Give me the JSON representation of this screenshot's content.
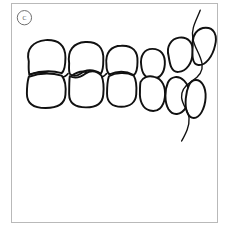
{
  "figure": {
    "panel_label": "C",
    "panel_label_shape": "circle",
    "caption_alt": "Lateral view line drawing of dental occlusion showing upper and lower posterior and anterior teeth with lip profile",
    "colors": {
      "line": "#111111",
      "background": "#ffffff",
      "panel_border": "#b9b9b9",
      "label": "#4a4a4a"
    },
    "illustration": {
      "type": "line-drawing",
      "subject": "dental-occlusion-lateral-view",
      "stroke_width_main": 2.6,
      "stroke_width_profile": 1.9,
      "upper_arch_label": "upper teeth row",
      "lower_arch_label": "lower teeth row",
      "profile_label": "lip soft tissue profile",
      "upper_teeth": [
        {
          "name": "upper-molar-1",
          "cx": 53,
          "cy": 85,
          "rx": 32,
          "ry": 26,
          "rot": -2,
          "kind": "molar"
        },
        {
          "name": "upper-molar-2",
          "cx": 112,
          "cy": 87,
          "rx": 28,
          "ry": 25,
          "rot": -1,
          "kind": "molar"
        },
        {
          "name": "upper-premolar-1",
          "cx": 166,
          "cy": 90,
          "rx": 26,
          "ry": 23,
          "rot": 0,
          "kind": "premolar"
        },
        {
          "name": "upper-premolar-2",
          "cx": 212,
          "cy": 92,
          "rx": 18,
          "ry": 22,
          "rot": 4,
          "kind": "premolar"
        },
        {
          "name": "upper-canine",
          "cx": 248,
          "cy": 83,
          "rx": 16,
          "ry": 24,
          "rot": 22,
          "kind": "canine"
        },
        {
          "name": "upper-incisor",
          "cx": 282,
          "cy": 76,
          "rx": 16,
          "ry": 25,
          "rot": 34,
          "kind": "incisor"
        }
      ],
      "lower_teeth": [
        {
          "name": "lower-molar-1",
          "cx": 53,
          "cy": 140,
          "rx": 32,
          "ry": 24,
          "rot": 1,
          "kind": "molar"
        },
        {
          "name": "lower-molar-2",
          "cx": 113,
          "cy": 141,
          "rx": 28,
          "ry": 23,
          "rot": 1,
          "kind": "molar"
        },
        {
          "name": "lower-premolar-1",
          "cx": 168,
          "cy": 142,
          "rx": 26,
          "ry": 22,
          "rot": 2,
          "kind": "premolar"
        },
        {
          "name": "lower-premolar-2",
          "cx": 213,
          "cy": 144,
          "rx": 18,
          "ry": 24,
          "rot": 7,
          "kind": "premolar"
        },
        {
          "name": "lower-canine",
          "cx": 246,
          "cy": 147,
          "rx": 15,
          "ry": 26,
          "rot": 20,
          "kind": "canine"
        },
        {
          "name": "lower-incisor",
          "cx": 274,
          "cy": 150,
          "rx": 13,
          "ry": 27,
          "rot": 28,
          "kind": "incisor"
        }
      ],
      "occlusal_contacts": [
        {
          "name": "occlusal-contact-left",
          "d": "M 26 113 C 40 107, 55 109, 66 114 C 74 118, 84 117, 90 112"
        },
        {
          "name": "occlusal-contact-mid",
          "d": "M 96 115 C 108 107, 118 106, 127 113 C 136 120, 146 118, 152 111"
        }
      ],
      "profile_line": {
        "name": "lip-profile-line",
        "d": "M 302 12 C 296 28, 288 40, 291 56 C 294 72, 302 80, 305 96 C 307 110, 298 118, 288 124 C 279 130, 272 138, 273 150 C 274 162, 283 170, 284 182 C 285 196, 279 208, 273 219"
      }
    }
  }
}
